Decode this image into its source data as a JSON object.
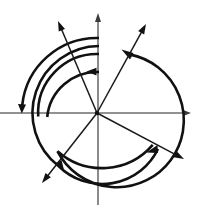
{
  "figure": {
    "background_color": "#ffffff",
    "width": 198,
    "height": 218,
    "center": {
      "x": 97,
      "y": 113
    },
    "stroke_colors": {
      "axis": "#6e6e6e",
      "ray": "#1a1a1a",
      "arc": "#111111"
    }
  },
  "chart_data": {
    "type": "scatter",
    "subtitle": "",
    "xlabel": "",
    "ylabel": "",
    "grid": false,
    "legend": null,
    "coordinate_system": "polar-on-cartesian",
    "origin": {
      "x": 97,
      "y": 113
    },
    "axes": [
      {
        "name": "horizontal-axis",
        "orientation": "horizontal",
        "from": {
          "x": 0,
          "y": 113
        },
        "to": {
          "x": 191,
          "y": 113
        },
        "arrowhead_at": "right",
        "color": "#6e6e6e"
      },
      {
        "name": "vertical-axis",
        "orientation": "vertical",
        "from": {
          "x": 98,
          "y": 205
        },
        "to": {
          "x": 98,
          "y": 14
        },
        "arrowhead_at": "top",
        "color": "#6e6e6e"
      }
    ],
    "rays": [
      {
        "name": "ray-upper-left",
        "angle_deg": 118,
        "length": 100,
        "tip": {
          "x": 58,
          "y": 21
        },
        "arrowhead": true
      },
      {
        "name": "ray-upper-right",
        "angle_deg": 61,
        "length": 100,
        "tip": {
          "x": 146,
          "y": 24
        },
        "arrowhead": true
      },
      {
        "name": "ray-lower-right",
        "angle_deg": -27,
        "length": 98,
        "tip": {
          "x": 184,
          "y": 159
        },
        "arrowhead": true
      },
      {
        "name": "ray-lower-left",
        "angle_deg": -125,
        "length": 96,
        "tip": {
          "x": 42,
          "y": 183
        },
        "arrowhead": true
      }
    ],
    "arcs": [
      {
        "name": "arc-outer-circle",
        "radius": 67,
        "start_angle_deg": 61,
        "end_angle_deg": -290,
        "sweep": "clockwise",
        "arrowheads": [
          {
            "at_angle_deg": 61,
            "position": {
              "x": 122,
              "y": 50
            }
          },
          {
            "at_angle_deg": -27,
            "position": {
              "x": 155,
              "y": 150
            }
          }
        ]
      },
      {
        "name": "arc-ring-1",
        "radius": 75,
        "start_angle_deg": 90,
        "end_angle_deg": 186,
        "sweep": "counterclockwise",
        "arrowheads": [
          {
            "at_angle_deg": 186,
            "position": {
              "x": 22,
              "y": 107
            }
          }
        ]
      },
      {
        "name": "arc-ring-2",
        "radius": 67,
        "start_angle_deg": 90,
        "end_angle_deg": 235,
        "sweep": "counterclockwise",
        "arrowheads": [
          {
            "at_angle_deg": 235,
            "position": {
              "x": 60,
              "y": 168
            }
          }
        ]
      },
      {
        "name": "arc-ring-3",
        "radius": 59,
        "start_angle_deg": 90,
        "end_angle_deg": 180,
        "sweep": "counterclockwise",
        "arrowheads": []
      },
      {
        "name": "arc-ring-4",
        "radius": 50,
        "start_angle_deg": 90,
        "end_angle_deg": 180,
        "sweep": "counterclockwise",
        "arrowheads": [
          {
            "at_angle_deg": 97,
            "position": {
              "x": 88,
              "y": 72
            }
          }
        ]
      }
    ],
    "arc_axis_crossings_left_x": [
      22,
      30,
      38,
      47
    ],
    "arc_axis_crossing_right_x": [
      164
    ],
    "arc_vertical_crossings_top_y": [
      33,
      45,
      55,
      72
    ],
    "arc_vertical_crossings_bottom_y": [
      168,
      180
    ]
  }
}
